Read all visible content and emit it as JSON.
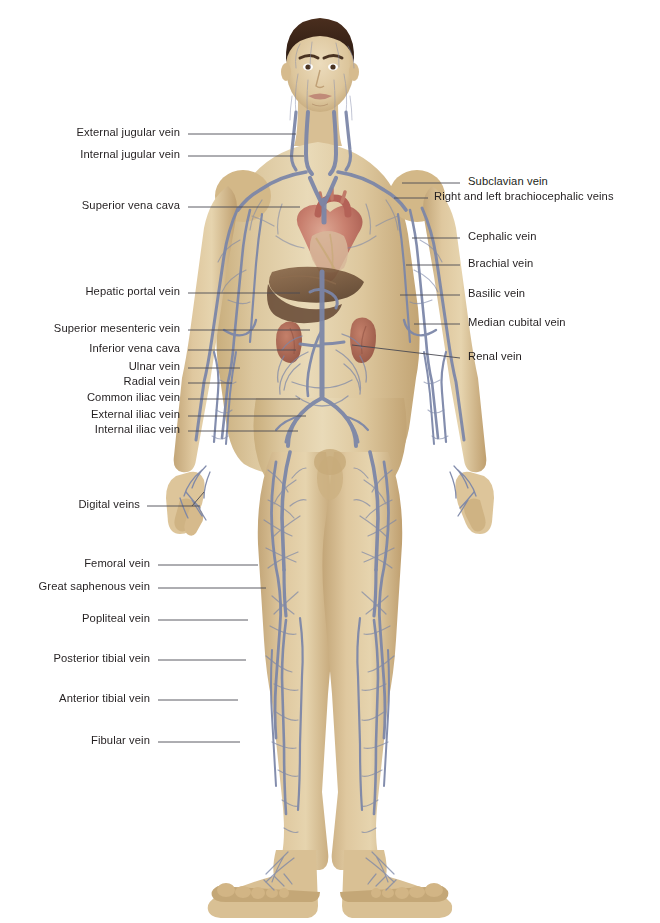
{
  "figure": {
    "background_color": "#ffffff",
    "label_color": "#231f20",
    "leader_color": "#4a4a52",
    "palette": {
      "skin_light": "#e8d6b2",
      "skin_mid": "#d9c191",
      "skin_shadow": "#c2a877",
      "vein_blue": "#7b86a8",
      "vein_blue_dark": "#5d6887",
      "heart_red": "#c06a62",
      "heart_pink": "#d9a08f",
      "liver_brown": "#7b5c42",
      "kidney_red": "#b5705d",
      "hair_brown": "#3a251a"
    }
  },
  "labels_left": [
    {
      "id": "external-jugular-vein",
      "text": "External jugular vein",
      "text_x": 180,
      "text_y": 137,
      "line_x1": 188,
      "line_y1": 134,
      "line_x2": 296,
      "line_y2": 134
    },
    {
      "id": "internal-jugular-vein",
      "text": "Internal jugular vein",
      "text_x": 180,
      "text_y": 159,
      "line_x1": 188,
      "line_y1": 156,
      "line_x2": 304,
      "line_y2": 156
    },
    {
      "id": "superior-vena-cava",
      "text": "Superior vena cava",
      "text_x": 180,
      "text_y": 210,
      "line_x1": 188,
      "line_y1": 207,
      "line_x2": 300,
      "line_y2": 207
    },
    {
      "id": "hepatic-portal-vein",
      "text": "Hepatic portal vein",
      "text_x": 180,
      "text_y": 296,
      "line_x1": 188,
      "line_y1": 293,
      "line_x2": 300,
      "line_y2": 293
    },
    {
      "id": "superior-mesenteric-vein",
      "text": "Superior mesenteric vein",
      "text_x": 180,
      "text_y": 333,
      "line_x1": 188,
      "line_y1": 330,
      "line_x2": 310,
      "line_y2": 330
    },
    {
      "id": "inferior-vena-cava",
      "text": "Inferior vena cava",
      "text_x": 180,
      "text_y": 353,
      "line_x1": 188,
      "line_y1": 350,
      "line_x2": 296,
      "line_y2": 350
    },
    {
      "id": "ulnar-vein",
      "text": "Ulnar vein",
      "text_x": 180,
      "text_y": 371,
      "line_x1": 188,
      "line_y1": 368,
      "line_x2": 240,
      "line_y2": 368
    },
    {
      "id": "radial-vein",
      "text": "Radial vein",
      "text_x": 180,
      "text_y": 386,
      "line_x1": 188,
      "line_y1": 383,
      "line_x2": 232,
      "line_y2": 383
    },
    {
      "id": "common-iliac-vein",
      "text": "Common iliac vein",
      "text_x": 180,
      "text_y": 402,
      "line_x1": 188,
      "line_y1": 399,
      "line_x2": 300,
      "line_y2": 399
    },
    {
      "id": "external-iliac-vein",
      "text": "External iliac vein",
      "text_x": 180,
      "text_y": 419,
      "line_x1": 188,
      "line_y1": 416,
      "line_x2": 306,
      "line_y2": 416
    },
    {
      "id": "internal-iliac-vein",
      "text": "Internal iliac vein",
      "text_x": 180,
      "text_y": 434,
      "line_x1": 188,
      "line_y1": 431,
      "line_x2": 298,
      "line_y2": 431
    },
    {
      "id": "digital-veins",
      "text": "Digital veins",
      "text_x": 140,
      "text_y": 509,
      "line_x1": 147,
      "line_y1": 506,
      "line_x2": 200,
      "line_y2": 506
    },
    {
      "id": "femoral-vein",
      "text": "Femoral vein",
      "text_x": 150,
      "text_y": 568,
      "line_x1": 158,
      "line_y1": 565,
      "line_x2": 258,
      "line_y2": 565
    },
    {
      "id": "great-saphenous-vein",
      "text": "Great saphenous vein",
      "text_x": 150,
      "text_y": 591,
      "line_x1": 158,
      "line_y1": 588,
      "line_x2": 266,
      "line_y2": 588
    },
    {
      "id": "popliteal-vein",
      "text": "Popliteal vein",
      "text_x": 150,
      "text_y": 623,
      "line_x1": 158,
      "line_y1": 620,
      "line_x2": 248,
      "line_y2": 620
    },
    {
      "id": "posterior-tibial-vein",
      "text": "Posterior tibial vein",
      "text_x": 150,
      "text_y": 663,
      "line_x1": 158,
      "line_y1": 660,
      "line_x2": 246,
      "line_y2": 660
    },
    {
      "id": "anterior-tibial-vein",
      "text": "Anterior tibial vein",
      "text_x": 150,
      "text_y": 703,
      "line_x1": 158,
      "line_y1": 700,
      "line_x2": 238,
      "line_y2": 700
    },
    {
      "id": "fibular-vein",
      "text": "Fibular vein",
      "text_x": 150,
      "text_y": 745,
      "line_x1": 158,
      "line_y1": 742,
      "line_x2": 240,
      "line_y2": 742
    }
  ],
  "labels_right": [
    {
      "id": "subclavian-vein",
      "text": "Subclavian vein",
      "text_x": 468,
      "text_y": 186,
      "line_x1": 402,
      "line_y1": 183,
      "line_x2": 460,
      "line_y2": 183
    },
    {
      "id": "right-and-left-brachiocephalic-veins",
      "text": "Right and left brachiocephalic veins",
      "text_x": 434,
      "text_y": 201,
      "line_x1": 394,
      "line_y1": 198,
      "line_x2": 428,
      "line_y2": 198
    },
    {
      "id": "cephalic-vein",
      "text": "Cephalic vein",
      "text_x": 468,
      "text_y": 241,
      "line_x1": 412,
      "line_y1": 238,
      "line_x2": 460,
      "line_y2": 238
    },
    {
      "id": "brachial-vein",
      "text": "Brachial vein",
      "text_x": 468,
      "text_y": 268,
      "line_x1": 406,
      "line_y1": 265,
      "line_x2": 460,
      "line_y2": 265
    },
    {
      "id": "basilic-vein",
      "text": "Basilic vein",
      "text_x": 468,
      "text_y": 298,
      "line_x1": 400,
      "line_y1": 295,
      "line_x2": 460,
      "line_y2": 295
    },
    {
      "id": "median-cubital-vein",
      "text": "Median cubital vein",
      "text_x": 468,
      "text_y": 327,
      "line_x1": 414,
      "line_y1": 324,
      "line_x2": 460,
      "line_y2": 324
    },
    {
      "id": "renal-vein",
      "text": "Renal vein",
      "text_x": 468,
      "text_y": 361,
      "line_x1": 352,
      "line_y1": 345,
      "line_x2": 460,
      "line_y2": 358
    }
  ]
}
